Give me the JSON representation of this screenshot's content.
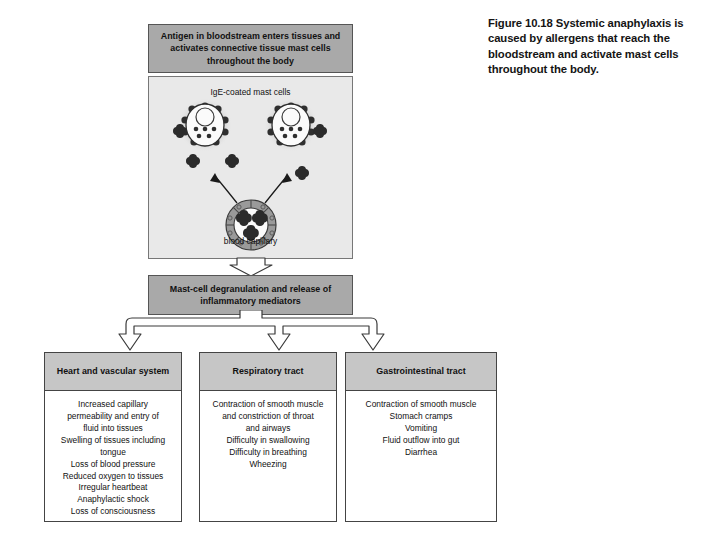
{
  "figure": {
    "caption": "Figure 10.18 Systemic anaphylaxis is caused by allergens that reach the bloodstream and activate mast cells throughout the body."
  },
  "flow": {
    "top_box": {
      "text": "Antigen in bloodstream enters tissues and activates connective tissue mast cells throughout the body"
    },
    "illustration": {
      "top_label": "IgE-coated mast cells",
      "bottom_label": "blood capillary",
      "icons": {
        "mast_cell": "mast-cell-icon",
        "allergen": "allergen-particle-icon",
        "capillary": "blood-capillary-icon",
        "uptake_arrow": "curved-arrow-icon"
      }
    },
    "middle_box": {
      "text": "Mast-cell degranulation and release of inflammatory mediators"
    },
    "outcomes": [
      {
        "title": "Heart and vascular system",
        "effects": [
          "Increased capillary",
          "permeability and entry of",
          "fluid into tissues",
          "Swelling of tissues including",
          "tongue",
          "Loss of blood pressure",
          "Reduced oxygen to tissues",
          "Irregular heartbeat",
          "Anaphylactic shock",
          "Loss of consciousness"
        ]
      },
      {
        "title": "Respiratory tract",
        "effects": [
          "Contraction of smooth muscle",
          "and constriction of throat",
          "and airways",
          "Difficulty in swallowing",
          "Difficulty in breathing",
          "Wheezing"
        ]
      },
      {
        "title": "Gastrointestinal tract",
        "effects": [
          "Contraction of smooth muscle",
          "Stomach cramps",
          "Vomiting",
          "Fluid outflow into gut",
          "Diarrhea"
        ]
      }
    ]
  },
  "colors": {
    "header_gray": "#a9a9a9",
    "panel_gray": "#e9e9e9",
    "outcome_head_gray": "#c6c6c6",
    "allergen_dark": "#2b2b2b",
    "capillary_ring": "#9a9a9a",
    "border_dark": "#444444",
    "page_white": "#ffffff"
  }
}
